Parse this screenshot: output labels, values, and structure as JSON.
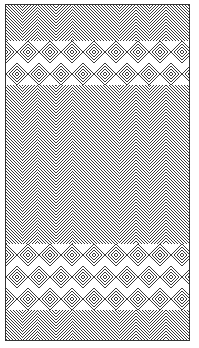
{
  "artwork": {
    "type": "woven-pattern-line-art",
    "line_color": "#222222",
    "background_color": "#ffffff",
    "frame": {
      "x": 5,
      "y": 4,
      "width": 185,
      "height": 337
    },
    "diamond_bands": [
      {
        "y_center": 58,
        "rows": 2
      },
      {
        "y_center": 272,
        "rows": 3
      }
    ],
    "chevron_columns_x": [
      32,
      66,
      130,
      160
    ],
    "line_spacing": 3
  }
}
